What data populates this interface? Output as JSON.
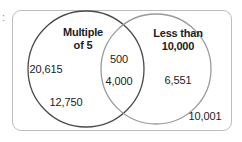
{
  "figure": {
    "type": "venn-diagram",
    "edge_mark": ":",
    "frame": {
      "border_color": "#bdbdbd",
      "background": "#ffffff"
    },
    "sets": [
      {
        "id": "left",
        "label_line1": "Multiple",
        "label_line2": "of 5",
        "stroke_color": "#4a4a4a"
      },
      {
        "id": "right",
        "label_line1": "Less than",
        "label_line2": "10,000",
        "stroke_color": "#9a9a9a"
      }
    ],
    "regions": {
      "left_only": [
        "20,615",
        "12,750"
      ],
      "intersection": [
        "500",
        "4,000"
      ],
      "right_only": [
        "6,551"
      ],
      "outside": [
        "10,001"
      ]
    }
  }
}
